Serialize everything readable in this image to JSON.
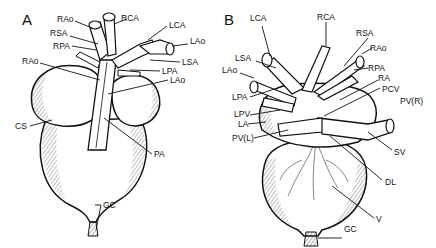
{
  "figure": {
    "panel_a": {
      "letter": "A",
      "labels": {
        "rao_top": "RAo",
        "rca": "RCA",
        "lca": "LCA",
        "rsa": "RSA",
        "lao_top": "LAo",
        "rpa": "RPA",
        "lsa": "LSA",
        "rao_side": "RAo",
        "lpa": "LPA",
        "lao_mid": "LAo",
        "cs": "CS",
        "pa": "PA",
        "gc": "GC"
      }
    },
    "panel_b": {
      "letter": "B",
      "labels": {
        "lca": "LCA",
        "rca": "RCA",
        "rsa": "RSA",
        "rao": "RAo",
        "lsa": "LSA",
        "lao": "LAo",
        "rpa": "RPA",
        "ra": "RA",
        "pcv": "PCV",
        "lpa": "LPA",
        "pvr": "PV(R)",
        "lpv": "LPV",
        "la": "LA",
        "pvl": "PV(L)",
        "sv": "SV",
        "dl": "DL",
        "v": "V",
        "gc": "GC"
      }
    },
    "colors": {
      "ink": "#111111",
      "background": "#ffffff",
      "shade": "#9a9a9a"
    }
  }
}
